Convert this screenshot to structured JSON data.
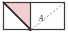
{
  "figure": {
    "canvas": {
      "width": 68,
      "height": 35
    },
    "colors": {
      "border": "#3a3a3a",
      "fill_pink": "#f3cfd2",
      "diagonal_solid": "#2e2a2c",
      "diagonal_dashed": "#8f8f93",
      "background": "#ffffff",
      "label": "#2b2b2b"
    },
    "outer_rect": {
      "x": 3,
      "y": 2,
      "width": 62,
      "height": 28
    },
    "divider": {
      "x": 30,
      "y1": 2,
      "y2": 30
    },
    "left_cell": {
      "name": "shaded-triangle-cell",
      "fill_label": "pink",
      "triangle_points": "3,2 30,2 30,30",
      "diagonal": {
        "x1": 3,
        "y1": 2,
        "x2": 30,
        "y2": 30,
        "style": "solid"
      },
      "vertex_marker": {
        "x": 30,
        "y": 30
      }
    },
    "right_cell": {
      "name": "dashed-diagonal-cell",
      "fill_label": "white",
      "diagonal": {
        "x1": 31,
        "y1": 30,
        "x2": 64,
        "y2": 3,
        "style": "dashed"
      },
      "label": "A",
      "label_position": {
        "x": 41,
        "y": 21
      }
    }
  }
}
